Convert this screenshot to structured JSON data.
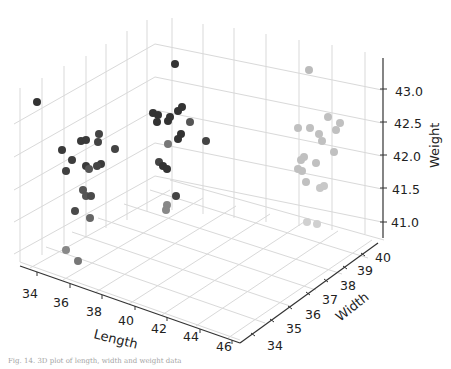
{
  "figure": {
    "caption": "Fig. 14. 3D plot of length, width and weight data"
  },
  "chart_data": {
    "type": "scatter",
    "subtype": "3d",
    "title": "",
    "xlabel": "Length",
    "ylabel": "Width",
    "zlabel": "Weight",
    "x_ticks": [
      "34",
      "36",
      "38",
      "40",
      "42",
      "44",
      "46"
    ],
    "y_ticks": [
      "34",
      "35",
      "36",
      "37",
      "38",
      "39",
      "40"
    ],
    "z_ticks": [
      "41.0",
      "41.5",
      "42.0",
      "42.5",
      "43.0"
    ],
    "xlim": [
      33,
      47
    ],
    "ylim": [
      33.5,
      40.5
    ],
    "zlim": [
      40.8,
      43.4
    ],
    "grid": true,
    "point_color": "#333333",
    "note": "Points are shaded by depth (near = dark, far = light). Screen positions estimated from pixels.",
    "points_screen": [
      {
        "x": 37,
        "y": 102,
        "shade": "#333333"
      },
      {
        "x": 62,
        "y": 150,
        "shade": "#3a3a3a"
      },
      {
        "x": 72,
        "y": 160,
        "shade": "#3d3d3d"
      },
      {
        "x": 66,
        "y": 171,
        "shade": "#404040"
      },
      {
        "x": 81,
        "y": 141,
        "shade": "#3a3a3a"
      },
      {
        "x": 86,
        "y": 140,
        "shade": "#3a3a3a"
      },
      {
        "x": 99,
        "y": 134,
        "shade": "#444444"
      },
      {
        "x": 98,
        "y": 142,
        "shade": "#444444"
      },
      {
        "x": 115,
        "y": 149,
        "shade": "#444444"
      },
      {
        "x": 101,
        "y": 164,
        "shade": "#3a3a3a"
      },
      {
        "x": 86,
        "y": 166,
        "shade": "#3a3a3a"
      },
      {
        "x": 89,
        "y": 169,
        "shade": "#555555"
      },
      {
        "x": 97,
        "y": 166,
        "shade": "#444444"
      },
      {
        "x": 83,
        "y": 190,
        "shade": "#555555"
      },
      {
        "x": 86,
        "y": 196,
        "shade": "#555555"
      },
      {
        "x": 91,
        "y": 196,
        "shade": "#4a4a4a"
      },
      {
        "x": 75,
        "y": 211,
        "shade": "#4a4a4a"
      },
      {
        "x": 90,
        "y": 218,
        "shade": "#666666"
      },
      {
        "x": 66,
        "y": 250,
        "shade": "#888888"
      },
      {
        "x": 78,
        "y": 261,
        "shade": "#777777"
      },
      {
        "x": 175,
        "y": 64,
        "shade": "#333333"
      },
      {
        "x": 153,
        "y": 113,
        "shade": "#333333"
      },
      {
        "x": 158,
        "y": 115,
        "shade": "#333333"
      },
      {
        "x": 157,
        "y": 122,
        "shade": "#333333"
      },
      {
        "x": 168,
        "y": 121,
        "shade": "#333333"
      },
      {
        "x": 170,
        "y": 117,
        "shade": "#333333"
      },
      {
        "x": 178,
        "y": 111,
        "shade": "#333333"
      },
      {
        "x": 182,
        "y": 107,
        "shade": "#333333"
      },
      {
        "x": 190,
        "y": 122,
        "shade": "#555555"
      },
      {
        "x": 181,
        "y": 134,
        "shade": "#333333"
      },
      {
        "x": 178,
        "y": 139,
        "shade": "#333333"
      },
      {
        "x": 168,
        "y": 144,
        "shade": "#777777"
      },
      {
        "x": 206,
        "y": 141,
        "shade": "#444444"
      },
      {
        "x": 159,
        "y": 162,
        "shade": "#444444"
      },
      {
        "x": 163,
        "y": 166,
        "shade": "#333333"
      },
      {
        "x": 167,
        "y": 169,
        "shade": "#333333"
      },
      {
        "x": 176,
        "y": 196,
        "shade": "#444444"
      },
      {
        "x": 167,
        "y": 205,
        "shade": "#888888"
      },
      {
        "x": 166,
        "y": 210,
        "shade": "#888888"
      },
      {
        "x": 309,
        "y": 70,
        "shade": "#bbbbbb"
      },
      {
        "x": 328,
        "y": 117,
        "shade": "#c0c0c0"
      },
      {
        "x": 340,
        "y": 123,
        "shade": "#c0c0c0"
      },
      {
        "x": 336,
        "y": 130,
        "shade": "#c0c0c0"
      },
      {
        "x": 298,
        "y": 128,
        "shade": "#c0c0c0"
      },
      {
        "x": 310,
        "y": 128,
        "shade": "#c0c0c0"
      },
      {
        "x": 319,
        "y": 134,
        "shade": "#c0c0c0"
      },
      {
        "x": 322,
        "y": 141,
        "shade": "#c0c0c0"
      },
      {
        "x": 334,
        "y": 152,
        "shade": "#c0c0c0"
      },
      {
        "x": 301,
        "y": 160,
        "shade": "#c0c0c0"
      },
      {
        "x": 304,
        "y": 157,
        "shade": "#c0c0c0"
      },
      {
        "x": 316,
        "y": 163,
        "shade": "#c0c0c0"
      },
      {
        "x": 298,
        "y": 169,
        "shade": "#c0c0c0"
      },
      {
        "x": 302,
        "y": 171,
        "shade": "#c0c0c0"
      },
      {
        "x": 306,
        "y": 182,
        "shade": "#c0c0c0"
      },
      {
        "x": 320,
        "y": 188,
        "shade": "#c8c8c8"
      },
      {
        "x": 324,
        "y": 186,
        "shade": "#c8c8c8"
      },
      {
        "x": 307,
        "y": 222,
        "shade": "#d0d0d0"
      },
      {
        "x": 317,
        "y": 224,
        "shade": "#d0d0d0"
      }
    ]
  }
}
